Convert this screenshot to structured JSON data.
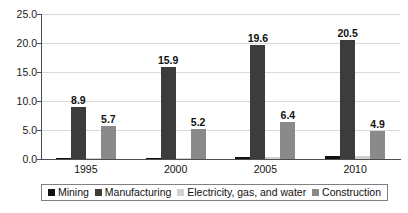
{
  "chart_data": {
    "type": "bar",
    "title": "",
    "xlabel": "",
    "ylabel": "",
    "categories": [
      "1995",
      "2000",
      "2005",
      "2010"
    ],
    "ylim": [
      0.0,
      25.0
    ],
    "ytick_labels": [
      "25.0",
      "20.0",
      "15.0",
      "10.0",
      "5.0",
      "0.0"
    ],
    "ytick_values": [
      25.0,
      20.0,
      15.0,
      10.0,
      5.0,
      0.0
    ],
    "grid": true,
    "legend_position": "bottom",
    "series": [
      {
        "name": "Mining",
        "color": "#111111",
        "values": [
          0.2,
          0.2,
          0.4,
          0.6
        ],
        "labels": [
          "",
          "",
          "",
          ""
        ]
      },
      {
        "name": "Manufacturing",
        "color": "#3c3c3c",
        "values": [
          8.9,
          15.9,
          19.6,
          20.5
        ],
        "labels": [
          "8.9",
          "15.9",
          "19.6",
          "20.5"
        ]
      },
      {
        "name": "Electricity, gas, and water",
        "color": "#d0d0d0",
        "values": [
          0.1,
          0.2,
          0.3,
          0.5
        ],
        "labels": [
          "",
          "",
          "",
          ""
        ]
      },
      {
        "name": "Construction",
        "color": "#8a8a8a",
        "values": [
          5.7,
          5.2,
          6.4,
          4.9
        ],
        "labels": [
          "5.7",
          "5.2",
          "6.4",
          "4.9"
        ]
      }
    ]
  }
}
